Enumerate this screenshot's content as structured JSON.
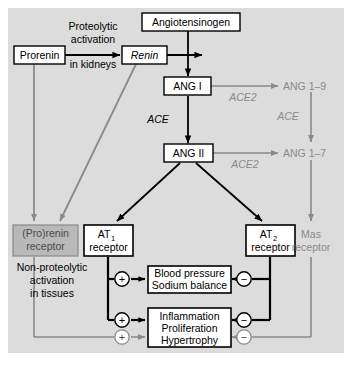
{
  "figure": {
    "title_visible": false,
    "background_color": "#dcdcdc",
    "panel_border_color": "#ffffff",
    "black": "#000000",
    "gray": "#8a8a8a",
    "box_fill": "#ffffff",
    "gray_box_fill": "#b9b9b9"
  },
  "nodes": {
    "prorenin": "Prorenin",
    "renin": "Renin",
    "angiotensinogen": "Angiotensinogen",
    "ang_i": "ANG I",
    "ang_ii": "ANG II",
    "ang_1_9": "ANG 1–9",
    "ang_1_7": "ANG 1–7",
    "prorenin_receptor_line1": "(Pro)renin",
    "prorenin_receptor_line2": "receptor",
    "at1_receptor_line1": "AT",
    "at1_receptor_sub": "1",
    "at1_receptor_line2": "receptor",
    "at2_receptor_line1": "AT",
    "at2_receptor_sub": "2",
    "at2_receptor_line2": "receptor",
    "mas_receptor_line1": "Mas",
    "mas_receptor_line2": "receptor",
    "blood_pressure_line1": "Blood pressure",
    "blood_pressure_line2": "Sodium balance",
    "inflammation_line1": "Inflammation",
    "inflammation_line2": "Proliferation",
    "inflammation_line3": "Hypertrophy"
  },
  "labels": {
    "proteolytic_line1": "Proteolytic",
    "proteolytic_line2": "activation",
    "proteolytic_line3": "in kidneys",
    "nonproteolytic_line1": "Non-proteolytic",
    "nonproteolytic_line2": "activation",
    "nonproteolytic_line3": "in tissues",
    "ace_left": "ACE",
    "ace_right": "ACE",
    "ace2_top": "ACE2",
    "ace2_bottom": "ACE2"
  },
  "signs": {
    "plus": "+",
    "minus": "−",
    "plus_bp_at1": "+",
    "plus_infl_at1": "+",
    "plus_infl_prorenin": "+",
    "minus_bp_at2": "−",
    "minus_infl_at2": "−",
    "minus_infl_mas": "−"
  }
}
